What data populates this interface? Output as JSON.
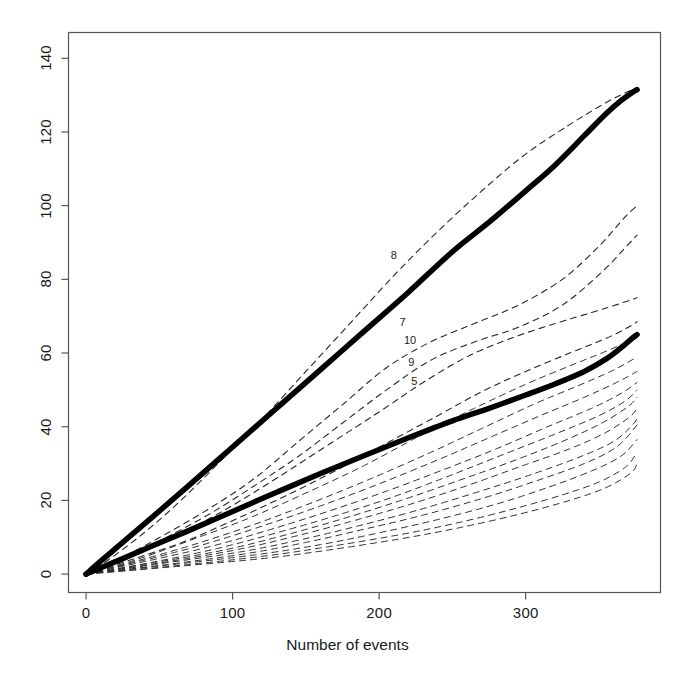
{
  "chart_data": {
    "type": "line",
    "title": "",
    "subtitle": "",
    "xlabel": "Number of events",
    "ylabel": "",
    "xlim": [
      -12,
      392
    ],
    "ylim": [
      -5,
      147
    ],
    "xticks": [
      0,
      100,
      200,
      300
    ],
    "yticks": [
      0,
      20,
      40,
      60,
      80,
      100,
      120,
      140
    ],
    "xtick_labels": [
      "0",
      "100",
      "200",
      "300"
    ],
    "ytick_labels": [
      "0",
      "20",
      "40",
      "60",
      "80",
      "100",
      "120",
      "140"
    ],
    "grid": false,
    "legend_position": "none",
    "box": true,
    "annotations": [
      {
        "text": "8",
        "x": 212,
        "y": 86
      },
      {
        "text": "7",
        "x": 218,
        "y": 68
      },
      {
        "text": "10",
        "x": 221,
        "y": 63
      },
      {
        "text": "9",
        "x": 224,
        "y": 57
      },
      {
        "text": "5",
        "x": 226,
        "y": 52
      }
    ],
    "series": [
      {
        "name": "upper-bound",
        "style": "solid",
        "linewidth": 5.5,
        "color": "#000000",
        "x": [
          0,
          10,
          25,
          45,
          70,
          100,
          130,
          160,
          190,
          220,
          250,
          275,
          300,
          320,
          340,
          355,
          365,
          372,
          376
        ],
        "y": [
          0,
          3.5,
          8.6,
          15.4,
          24.0,
          34.5,
          45.0,
          55.5,
          66.0,
          76.5,
          87.5,
          95.5,
          104.0,
          111.0,
          119.0,
          125.0,
          128.5,
          130.5,
          131.5
        ]
      },
      {
        "name": "mean-curve",
        "style": "solid",
        "linewidth": 5.5,
        "color": "#000000",
        "x": [
          0,
          10,
          25,
          45,
          70,
          100,
          130,
          160,
          190,
          220,
          250,
          275,
          300,
          320,
          340,
          355,
          365,
          372,
          376
        ],
        "y": [
          0,
          1.7,
          4.2,
          7.6,
          11.8,
          17.0,
          22.2,
          27.3,
          32.2,
          37.0,
          41.6,
          45.0,
          48.6,
          51.6,
          55.0,
          58.4,
          61.4,
          63.8,
          65.0
        ]
      },
      {
        "name": "unit-8",
        "style": "dashed",
        "linewidth": 1.1,
        "color": "#262626",
        "x": [
          0,
          20,
          45,
          70,
          95,
          120,
          150,
          180,
          210,
          240,
          270,
          300,
          330,
          355,
          370,
          376
        ],
        "y": [
          0,
          5.2,
          13.0,
          22.0,
          32.0,
          42.0,
          55.0,
          68.0,
          81.0,
          93.0,
          104.0,
          114.0,
          122.0,
          128.0,
          131.0,
          132.0
        ]
      },
      {
        "name": "unit-7",
        "style": "dashed",
        "linewidth": 1.1,
        "color": "#262626",
        "x": [
          0,
          25,
          55,
          85,
          115,
          145,
          175,
          205,
          235,
          265,
          295,
          325,
          350,
          368,
          376
        ],
        "y": [
          0,
          4.6,
          11.0,
          18.0,
          26.0,
          36.0,
          46.0,
          56.0,
          63.0,
          68.0,
          73.0,
          80.0,
          89.0,
          97.0,
          100.0
        ]
      },
      {
        "name": "unit-10",
        "style": "dashed",
        "linewidth": 1.1,
        "color": "#262626",
        "x": [
          0,
          25,
          55,
          85,
          115,
          145,
          175,
          205,
          235,
          265,
          295,
          325,
          352,
          370,
          376
        ],
        "y": [
          0,
          4.2,
          10.0,
          16.5,
          24.0,
          32.0,
          41.0,
          50.0,
          58.0,
          63.0,
          67.0,
          73.0,
          82.0,
          89.5,
          92.0
        ]
      },
      {
        "name": "unit-9",
        "style": "dashed",
        "linewidth": 1.1,
        "color": "#262626",
        "x": [
          0,
          30,
          60,
          95,
          130,
          165,
          200,
          230,
          260,
          290,
          320,
          345,
          365,
          376
        ],
        "y": [
          0,
          4.5,
          10.0,
          17.5,
          26.0,
          35.0,
          44.0,
          52.0,
          59.0,
          64.0,
          68.0,
          71.0,
          73.5,
          75.0
        ]
      },
      {
        "name": "unit-5",
        "style": "dashed",
        "linewidth": 1.1,
        "color": "#262626",
        "x": [
          0,
          30,
          65,
          100,
          135,
          170,
          205,
          240,
          270,
          300,
          330,
          355,
          370,
          376
        ],
        "y": [
          0,
          3.8,
          8.5,
          14.5,
          21.0,
          28.0,
          35.5,
          43.0,
          49.5,
          55.0,
          60.0,
          64.0,
          67.0,
          68.5
        ]
      },
      {
        "name": "unit-a",
        "style": "dashed",
        "linewidth": 1.0,
        "color": "#303030",
        "x": [
          0,
          35,
          70,
          110,
          150,
          190,
          230,
          265,
          300,
          330,
          355,
          372,
          376
        ],
        "y": [
          0,
          4.0,
          9.0,
          15.0,
          22.0,
          29.5,
          38.0,
          45.0,
          51.5,
          56.5,
          60.5,
          63.5,
          64.0
        ]
      },
      {
        "name": "unit-b",
        "style": "dashed",
        "linewidth": 1.0,
        "color": "#303030",
        "x": [
          0,
          35,
          75,
          115,
          155,
          195,
          235,
          270,
          305,
          335,
          358,
          372,
          376
        ],
        "y": [
          0,
          3.6,
          8.2,
          13.5,
          19.5,
          26.0,
          33.0,
          39.5,
          46.0,
          51.0,
          55.0,
          58.0,
          59.0
        ]
      },
      {
        "name": "unit-c",
        "style": "dashed",
        "linewidth": 1.0,
        "color": "#303030",
        "x": [
          0,
          40,
          80,
          120,
          160,
          200,
          240,
          275,
          310,
          340,
          362,
          376
        ],
        "y": [
          0,
          3.8,
          8.0,
          13.0,
          18.5,
          24.5,
          31.0,
          37.0,
          43.0,
          48.0,
          52.0,
          55.0
        ]
      },
      {
        "name": "unit-d",
        "style": "dashed",
        "linewidth": 1.0,
        "color": "#303030",
        "x": [
          0,
          40,
          85,
          125,
          165,
          205,
          245,
          280,
          315,
          345,
          365,
          376
        ],
        "y": [
          0,
          3.4,
          7.5,
          12.0,
          17.0,
          22.5,
          28.5,
          34.0,
          40.0,
          45.0,
          49.0,
          52.0
        ]
      },
      {
        "name": "unit-e",
        "style": "dashed",
        "linewidth": 1.0,
        "color": "#303030",
        "x": [
          0,
          45,
          90,
          130,
          170,
          210,
          250,
          285,
          320,
          350,
          368,
          376
        ],
        "y": [
          0,
          3.2,
          7.0,
          11.2,
          15.8,
          21.0,
          27.0,
          32.5,
          38.0,
          43.0,
          47.0,
          50.0
        ]
      },
      {
        "name": "unit-f",
        "style": "dashed",
        "linewidth": 1.0,
        "color": "#303030",
        "x": [
          0,
          45,
          95,
          135,
          175,
          215,
          255,
          290,
          325,
          352,
          370,
          376
        ],
        "y": [
          0,
          3.0,
          6.6,
          10.5,
          15.0,
          20.0,
          25.5,
          30.5,
          36.0,
          41.0,
          45.5,
          48.0
        ]
      },
      {
        "name": "unit-g",
        "style": "dashed",
        "linewidth": 1.0,
        "color": "#303030",
        "x": [
          0,
          50,
          100,
          140,
          180,
          220,
          260,
          295,
          330,
          355,
          372,
          376
        ],
        "y": [
          0,
          3.0,
          6.4,
          10.0,
          14.2,
          18.8,
          24.0,
          29.0,
          34.0,
          38.5,
          43.0,
          45.5
        ]
      },
      {
        "name": "unit-h",
        "style": "dashed",
        "linewidth": 1.0,
        "color": "#303030",
        "x": [
          0,
          50,
          105,
          145,
          185,
          225,
          265,
          300,
          335,
          360,
          374,
          376
        ],
        "y": [
          0,
          2.8,
          6.0,
          9.2,
          13.0,
          17.2,
          22.0,
          26.5,
          31.5,
          36.0,
          41.0,
          43.0
        ]
      },
      {
        "name": "unit-i",
        "style": "dashed",
        "linewidth": 1.0,
        "color": "#303030",
        "x": [
          0,
          55,
          110,
          150,
          190,
          230,
          270,
          305,
          340,
          362,
          375,
          376
        ],
        "y": [
          0,
          2.6,
          5.6,
          8.6,
          12.2,
          16.0,
          20.5,
          25.0,
          30.0,
          34.5,
          40.0,
          41.0
        ]
      },
      {
        "name": "unit-j",
        "style": "dashed",
        "linewidth": 1.0,
        "color": "#303030",
        "x": [
          0,
          55,
          115,
          160,
          200,
          240,
          280,
          315,
          345,
          365,
          376
        ],
        "y": [
          0,
          2.4,
          5.2,
          8.0,
          11.2,
          14.8,
          19.0,
          23.5,
          28.0,
          32.0,
          36.5
        ]
      },
      {
        "name": "unit-k",
        "style": "dashed",
        "linewidth": 1.0,
        "color": "#303030",
        "x": [
          0,
          60,
          120,
          165,
          210,
          250,
          290,
          325,
          350,
          368,
          376
        ],
        "y": [
          0,
          2.2,
          4.8,
          7.4,
          10.4,
          13.6,
          17.5,
          21.5,
          25.0,
          29.0,
          33.0
        ]
      },
      {
        "name": "unit-l",
        "style": "dashed",
        "linewidth": 1.0,
        "color": "#303030",
        "x": [
          0,
          60,
          125,
          170,
          215,
          255,
          295,
          330,
          355,
          372,
          376
        ],
        "y": [
          0,
          2.0,
          4.4,
          6.8,
          9.6,
          12.6,
          16.2,
          20.0,
          23.5,
          27.5,
          30.0
        ]
      }
    ]
  },
  "axes": {
    "x_title": "Number of events"
  },
  "labels": {
    "l8": "8",
    "l7": "7",
    "l10": "10",
    "l9": "9",
    "l5": "5"
  }
}
